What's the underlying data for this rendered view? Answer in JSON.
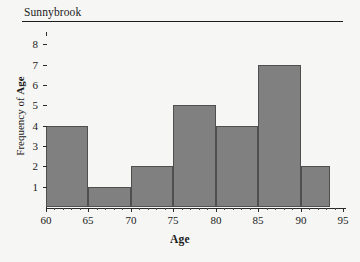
{
  "chart_data": {
    "type": "bar",
    "title": "Sunnybrook",
    "xlabel": "Age",
    "ylabel_prefix": "Frequency of ",
    "ylabel_bold": "Age",
    "ylabel_full": "Frequency of Age",
    "categories": [
      "60-65",
      "65-70",
      "70-75",
      "75-80",
      "80-85",
      "85-90",
      "90-95"
    ],
    "bin_edges": [
      60,
      65,
      70,
      75,
      80,
      85,
      90,
      93.5
    ],
    "values": [
      4,
      1,
      2,
      5,
      4,
      7,
      2
    ],
    "xlim": [
      60,
      95
    ],
    "ylim": [
      0,
      8.4
    ],
    "x_ticks": [
      "60",
      "65",
      "70",
      "75",
      "80",
      "85",
      "90",
      "95"
    ],
    "x_tick_values": [
      60,
      65,
      70,
      75,
      80,
      85,
      90,
      95
    ],
    "y_ticks": [
      "1",
      "2",
      "3",
      "4",
      "5",
      "6",
      "7",
      "8"
    ],
    "y_tick_values": [
      1,
      2,
      3,
      4,
      5,
      6,
      7,
      8
    ],
    "grid": false,
    "legend": null,
    "bar_color": "#808080",
    "bar_edge_color": "#4f4f4f",
    "background_color": "#f6f6f4",
    "axis_color": "#2a2a2a"
  }
}
